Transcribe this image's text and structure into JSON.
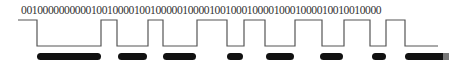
{
  "bit_string": "0010000000000100100001001000001000010010001000010001000010010010000",
  "waveform": {
    "stroke": "#555555",
    "high_y": 20,
    "low_y": 46,
    "points": [
      [
        18,
        20
      ],
      [
        37,
        20
      ],
      [
        37,
        46
      ],
      [
        101,
        46
      ],
      [
        101,
        20
      ],
      [
        117,
        20
      ],
      [
        117,
        46
      ],
      [
        148,
        46
      ],
      [
        148,
        20
      ],
      [
        163,
        20
      ],
      [
        163,
        46
      ],
      [
        197,
        46
      ],
      [
        197,
        20
      ],
      [
        227,
        20
      ],
      [
        227,
        46
      ],
      [
        244,
        46
      ],
      [
        244,
        20
      ],
      [
        265,
        20
      ],
      [
        265,
        46
      ],
      [
        295,
        46
      ],
      [
        295,
        20
      ],
      [
        322,
        20
      ],
      [
        322,
        46
      ],
      [
        344,
        46
      ],
      [
        344,
        20
      ],
      [
        370,
        20
      ],
      [
        370,
        46
      ],
      [
        386,
        46
      ],
      [
        386,
        20
      ],
      [
        405,
        20
      ],
      [
        405,
        46
      ],
      [
        438,
        46
      ]
    ]
  },
  "bars": {
    "color": "#111111",
    "y": 53,
    "height": 7,
    "segments": [
      [
        37,
        101
      ],
      [
        118,
        147
      ],
      [
        163,
        196
      ],
      [
        227,
        243
      ],
      [
        266,
        294
      ],
      [
        320,
        343
      ],
      [
        372,
        386
      ],
      [
        405,
        449
      ]
    ]
  },
  "bar_tail_color": "#777777"
}
